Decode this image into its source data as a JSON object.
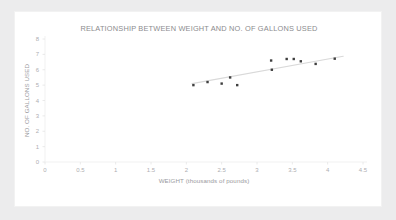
{
  "chart_data": {
    "type": "scatter",
    "title": "RELATIONSHIP BETWEEN WEIGHT AND NO. OF GALLONS USED",
    "xlabel": "WEIGHT (thousands of pounds)",
    "ylabel": "NO. OF GALLONS  USED",
    "xlim": [
      0,
      4.5
    ],
    "ylim": [
      0,
      8
    ],
    "xticks": [
      "0",
      "0.5",
      "1",
      "1.5",
      "2",
      "2.5",
      "3",
      "3.5",
      "4",
      "4.5"
    ],
    "xtick_values": [
      0,
      0.5,
      1,
      1.5,
      2,
      2.5,
      3,
      3.5,
      4,
      4.5
    ],
    "yticks": [
      "0",
      "1",
      "2",
      "3",
      "4",
      "5",
      "6",
      "7",
      "8"
    ],
    "ytick_values": [
      0,
      1,
      2,
      3,
      4,
      5,
      6,
      7,
      8
    ],
    "grid": false,
    "legend": false,
    "series": [
      {
        "name": "observations",
        "marker": "square",
        "color": "#3f3f3f",
        "points": [
          {
            "x": 2.1,
            "y": 5.0
          },
          {
            "x": 2.3,
            "y": 5.2
          },
          {
            "x": 2.5,
            "y": 5.1
          },
          {
            "x": 2.62,
            "y": 5.5
          },
          {
            "x": 2.72,
            "y": 5.0
          },
          {
            "x": 3.2,
            "y": 6.6
          },
          {
            "x": 3.21,
            "y": 6.0
          },
          {
            "x": 3.42,
            "y": 6.7
          },
          {
            "x": 3.52,
            "y": 6.7
          },
          {
            "x": 3.62,
            "y": 6.55
          },
          {
            "x": 3.83,
            "y": 6.38
          },
          {
            "x": 4.1,
            "y": 6.72
          }
        ]
      }
    ],
    "trendline": {
      "name": "linear-trend",
      "color": "#d9d9d9",
      "x0": 2.08,
      "y0": 5.1,
      "x1": 4.22,
      "y1": 6.88
    }
  }
}
